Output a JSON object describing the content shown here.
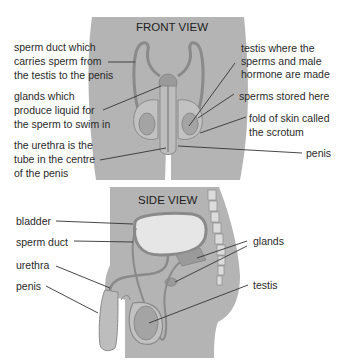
{
  "colors": {
    "body_fill": "#b4b4b4",
    "organ_fill": "#a0a0a0",
    "outline": "#8a8a8a",
    "bladder_fill": "#e6e6e6",
    "spine_fill": "#dcdcdc",
    "text": "#2a2a2a"
  },
  "front_view": {
    "title": "FRONT VIEW",
    "labels": {
      "sperm_duct": [
        "sperm duct which",
        "carries sperm from",
        "the testis to the penis"
      ],
      "glands": [
        "glands which",
        "produce liquid for",
        "the sperm to swim in"
      ],
      "urethra": [
        "the urethra is the",
        "tube in the centre",
        "of the penis"
      ],
      "testis": [
        "testis where the",
        "sperms and male",
        "hormone are made"
      ],
      "sperms_stored": [
        "sperms stored here"
      ],
      "scrotum": [
        "fold of skin called",
        "the scrotum"
      ],
      "penis": [
        "penis"
      ]
    }
  },
  "side_view": {
    "title": "SIDE VIEW",
    "labels": {
      "bladder": "bladder",
      "sperm_duct": "sperm duct",
      "urethra": "urethra",
      "penis": "penis",
      "glands": "glands",
      "testis": "testis"
    }
  }
}
